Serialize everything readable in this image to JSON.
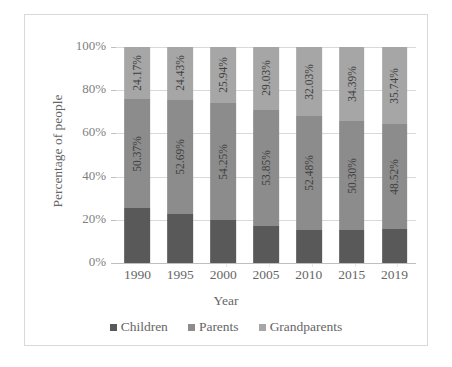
{
  "chart_data": {
    "type": "bar",
    "subtype": "stacked-100-percent",
    "title": "",
    "xlabel": "Year",
    "ylabel": "Percentage of people",
    "categories": [
      "1990",
      "1995",
      "2000",
      "2005",
      "2010",
      "2015",
      "2019"
    ],
    "ylim": [
      0,
      100
    ],
    "yticks": [
      "0%",
      "20%",
      "40%",
      "60%",
      "80%",
      "100%"
    ],
    "ytick_values": [
      0,
      20,
      40,
      60,
      80,
      100
    ],
    "grid": true,
    "legend_position": "bottom",
    "series": [
      {
        "name": "Children",
        "color": "#595959",
        "values": [
          25.46,
          22.88,
          19.81,
          17.12,
          15.49,
          15.31,
          15.74
        ],
        "labels": [
          "",
          "",
          "",
          "",
          "",
          "",
          ""
        ]
      },
      {
        "name": "Parents",
        "color": "#8c8c8c",
        "values": [
          50.37,
          52.69,
          54.25,
          53.85,
          52.48,
          50.3,
          48.52
        ],
        "labels": [
          "50.37%",
          "52.69%",
          "54.25%",
          "53.85%",
          "52.48%",
          "50.30%",
          "48.52%"
        ]
      },
      {
        "name": "Grandparents",
        "color": "#a6a6a6",
        "values": [
          24.17,
          24.43,
          25.94,
          29.03,
          32.03,
          34.39,
          35.74
        ],
        "labels": [
          "24.17%",
          "24.43%",
          "25.94%",
          "29.03%",
          "32.03%",
          "34.39%",
          "35.74%"
        ]
      }
    ]
  },
  "axis": {
    "y_title": "Percentage of people",
    "x_title": "Year",
    "y_ticks": [
      "100%",
      "80%",
      "60%",
      "40%",
      "20%",
      "0%"
    ],
    "x_ticks": [
      "1990",
      "1995",
      "2000",
      "2005",
      "2010",
      "2015",
      "2019"
    ]
  },
  "legend": {
    "items": [
      {
        "label": "Children",
        "color": "#595959"
      },
      {
        "label": "Parents",
        "color": "#8c8c8c"
      },
      {
        "label": "Grandparents",
        "color": "#a6a6a6"
      }
    ]
  }
}
